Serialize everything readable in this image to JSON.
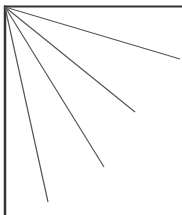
{
  "diagram": {
    "stroke_color": "#555555",
    "border_color": "#333333",
    "background": "#ffffff",
    "ray_count": 4
  }
}
